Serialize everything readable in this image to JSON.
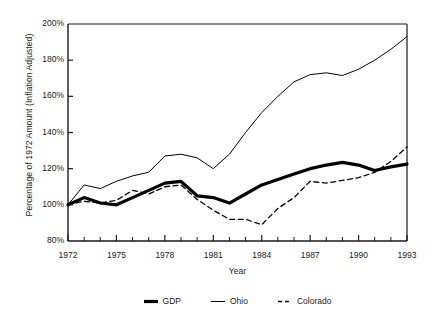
{
  "chart_data": {
    "type": "line",
    "title": "",
    "xlabel": "Year",
    "ylabel": "Percentage of 1972 Amount (Inflation Adjusted)",
    "xlim": [
      1972,
      1993
    ],
    "ylim": [
      80,
      200
    ],
    "y_unit": "%",
    "grid": false,
    "legend_position": "bottom",
    "x": [
      1972,
      1973,
      1974,
      1975,
      1976,
      1977,
      1978,
      1979,
      1980,
      1981,
      1982,
      1983,
      1984,
      1985,
      1986,
      1987,
      1988,
      1989,
      1990,
      1991,
      1992,
      1993
    ],
    "x_tick_labels": [
      "1972",
      "1975",
      "1978",
      "1981",
      "1984",
      "1987",
      "1990",
      "1993"
    ],
    "x_ticks": [
      1972,
      1975,
      1978,
      1981,
      1984,
      1987,
      1990,
      1993
    ],
    "x_minor_ticks": [
      1973,
      1974,
      1976,
      1977,
      1979,
      1980,
      1982,
      1983,
      1985,
      1986,
      1988,
      1989,
      1991,
      1992
    ],
    "y_ticks": [
      80,
      100,
      120,
      140,
      160,
      180,
      200
    ],
    "y_tick_labels": [
      "80%",
      "100%",
      "120%",
      "140%",
      "160%",
      "180%",
      "200%"
    ],
    "series": [
      {
        "name": "GDP",
        "style": "thick-solid",
        "color": "#000000",
        "line_width": 3.2,
        "values": [
          100,
          104,
          101,
          100,
          104,
          108,
          112,
          113,
          105,
          104,
          101,
          106,
          111,
          114,
          117,
          120,
          122,
          123.5,
          122,
          119,
          121,
          122.5
        ]
      },
      {
        "name": "Ohio",
        "style": "thin-solid",
        "color": "#000000",
        "line_width": 1,
        "values": [
          100,
          111,
          109,
          113,
          116,
          118,
          127,
          128,
          126,
          120,
          128,
          140,
          151,
          160,
          168,
          172,
          173,
          171.5,
          175,
          180,
          186,
          193
        ]
      },
      {
        "name": "Colorado",
        "style": "dashed",
        "color": "#000000",
        "line_width": 1.3,
        "values": [
          100,
          102,
          101,
          102.5,
          108,
          106,
          110,
          111,
          103,
          97,
          92,
          92,
          89,
          98,
          104,
          113,
          112,
          113.5,
          115,
          118,
          124,
          132
        ]
      }
    ]
  },
  "axes": {
    "x_title": "Year",
    "y_title": "Percentage of 1972 Amount (Inflation Adjusted)"
  },
  "legend": {
    "items": [
      {
        "label": "GDP",
        "swatch": "thick-solid-line-swatch"
      },
      {
        "label": "Ohio",
        "swatch": "thin-solid-line-swatch"
      },
      {
        "label": "Colorado",
        "swatch": "dashed-line-swatch"
      }
    ]
  }
}
